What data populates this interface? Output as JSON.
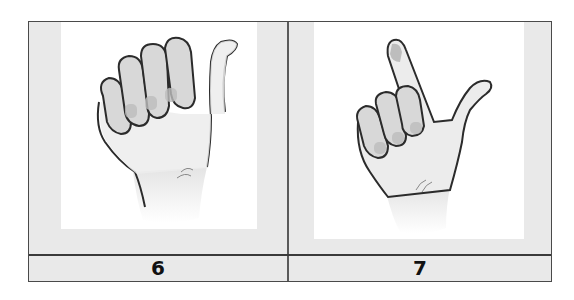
{
  "figure": {
    "cells": [
      {
        "label": "6",
        "image": "hand-sign-thumb-out-fist-icon",
        "description": "Hand with fingers curled into palm and thumb extended up"
      },
      {
        "label": "7",
        "image": "hand-sign-index-and-thumb-icon",
        "description": "Hand with index finger pointing up and thumb extended sideways"
      }
    ],
    "colors": {
      "border": "#4a4a4a",
      "cell_background": "#e9e9e9",
      "panel_background": "#ffffff",
      "label_text": "#111111"
    }
  }
}
